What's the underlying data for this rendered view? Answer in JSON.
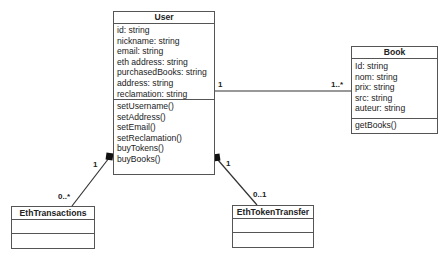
{
  "diagram": {
    "type": "uml-class-diagram",
    "classes": {
      "user": {
        "name": "User",
        "attributes": [
          "id: string",
          "nickname: string",
          "email: string",
          "eth address: string",
          "purchasedBooks: string",
          "address: string",
          "reclamation: string"
        ],
        "methods": [
          "setUsername()",
          "setAddress()",
          "setEmail()",
          "setReclamation()",
          "buyTokens()",
          "buyBooks()"
        ]
      },
      "book": {
        "name": "Book",
        "attributes": [
          "Id: string",
          "nom: string",
          "prix: string",
          "src: string",
          "auteur: string"
        ],
        "methods": [
          "getBooks()"
        ]
      },
      "eth_transactions": {
        "name": "EthTransactions",
        "attributes": [],
        "methods": []
      },
      "eth_token_transfer": {
        "name": "EthTokenTransfer",
        "attributes": [],
        "methods": []
      }
    },
    "relations": {
      "user_book": {
        "kind": "association",
        "source_multiplicity": "1",
        "target_multiplicity": "1..*"
      },
      "user_eth_transactions": {
        "kind": "composition",
        "source_multiplicity": "1",
        "target_multiplicity": "0..*"
      },
      "user_eth_token_transfer": {
        "kind": "composition",
        "source_multiplicity": "1",
        "target_multiplicity": "0..1"
      }
    },
    "colors": {
      "line": "#333333",
      "border": "#555555",
      "background": "#ffffff",
      "text": "#222222"
    }
  }
}
